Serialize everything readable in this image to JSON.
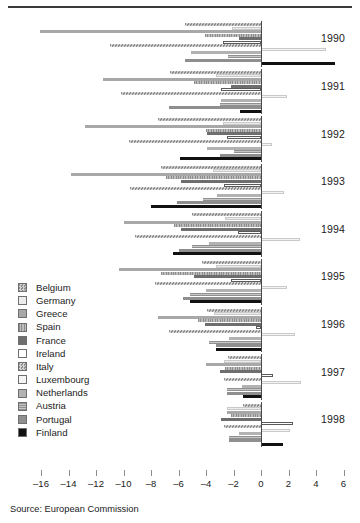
{
  "figure": {
    "source_note": "Source: European Commission"
  },
  "legend": {
    "items": [
      {
        "label": "Belgium",
        "fill": "#cfcfcf",
        "pattern": "checker"
      },
      {
        "label": "Germany",
        "fill": "#ececec",
        "pattern": "solid"
      },
      {
        "label": "Greece",
        "fill": "#a8a8a8",
        "pattern": "solid"
      },
      {
        "label": "Spain",
        "fill": "#bdbdbd",
        "pattern": "vstripe"
      },
      {
        "label": "France",
        "fill": "#6e6e6e",
        "pattern": "solid"
      },
      {
        "label": "Ireland",
        "fill": "#ffffff",
        "pattern": "solid"
      },
      {
        "label": "Italy",
        "fill": "#d6d6d6",
        "pattern": "checker"
      },
      {
        "label": "Luxembourg",
        "fill": "#f4f4f4",
        "pattern": "solid"
      },
      {
        "label": "Netherlands",
        "fill": "#b2b2b2",
        "pattern": "solid"
      },
      {
        "label": "Austria",
        "fill": "#c6c6c6",
        "pattern": "hstripe"
      },
      {
        "label": "Portugal",
        "fill": "#8f8f8f",
        "pattern": "solid"
      },
      {
        "label": "Finland",
        "fill": "#111111",
        "pattern": "solid"
      }
    ]
  },
  "chart_data": {
    "type": "bar",
    "orientation": "horizontal",
    "title": "",
    "xlabel": "",
    "ylabel": "",
    "xlim": [
      -17,
      7
    ],
    "xticks": [
      -16,
      -14,
      -12,
      -10,
      -8,
      -6,
      -4,
      -2,
      0,
      2,
      4,
      6
    ],
    "xtick_labels": [
      "–16",
      "–14",
      "–12",
      "–10",
      "–8",
      "–6",
      "–4",
      "–2",
      "0",
      "2",
      "4",
      "6"
    ],
    "grid": false,
    "legend_position": "left-middle",
    "categories": [
      "1990",
      "1991",
      "1992",
      "1993",
      "1994",
      "1995",
      "1996",
      "1997",
      "1998"
    ],
    "series": [
      {
        "name": "Belgium",
        "values": [
          -5.5,
          -6.6,
          -7.5,
          -7.3,
          -5.0,
          -4.3,
          -3.9,
          -2.4,
          -1.3
        ]
      },
      {
        "name": "Germany",
        "values": [
          -2.1,
          -3.3,
          -2.8,
          -3.5,
          -2.6,
          -3.3,
          -3.4,
          -2.7,
          -2.5
        ]
      },
      {
        "name": "Greece",
        "values": [
          -16.1,
          -11.5,
          -12.8,
          -13.8,
          -10.0,
          -10.3,
          -7.5,
          -4.0,
          -2.5
        ]
      },
      {
        "name": "Spain",
        "values": [
          -4.1,
          -4.9,
          -4.0,
          -6.9,
          -6.3,
          -7.3,
          -4.6,
          -2.6,
          -2.2
        ]
      },
      {
        "name": "France",
        "values": [
          -1.6,
          -2.2,
          -3.9,
          -5.8,
          -5.8,
          -4.9,
          -4.1,
          -3.0,
          -2.9
        ]
      },
      {
        "name": "Ireland",
        "values": [
          -2.8,
          -2.9,
          -2.5,
          -2.7,
          -1.7,
          -2.2,
          -0.4,
          0.9,
          2.3
        ]
      },
      {
        "name": "Italy",
        "values": [
          -11.0,
          -10.2,
          -9.6,
          -9.5,
          -9.2,
          -7.7,
          -6.7,
          -2.7,
          -2.7
        ]
      },
      {
        "name": "Luxembourg",
        "values": [
          4.7,
          1.9,
          0.8,
          1.7,
          2.8,
          1.9,
          2.5,
          2.9,
          2.1
        ]
      },
      {
        "name": "Netherlands",
        "values": [
          -5.1,
          -2.9,
          -3.9,
          -3.2,
          -3.8,
          -4.0,
          -2.3,
          -1.4,
          -1.6
        ]
      },
      {
        "name": "Austria",
        "values": [
          -2.4,
          -3.0,
          -2.0,
          -4.2,
          -5.0,
          -5.2,
          -3.8,
          -2.5,
          -2.3
        ]
      },
      {
        "name": "Portugal",
        "values": [
          -5.5,
          -6.7,
          -3.0,
          -6.1,
          -6.0,
          -5.7,
          -3.3,
          -2.5,
          -2.3
        ]
      },
      {
        "name": "Finland",
        "values": [
          5.4,
          -1.5,
          -5.9,
          -8.0,
          -6.4,
          -5.2,
          -3.3,
          -1.3,
          1.6
        ]
      }
    ]
  }
}
